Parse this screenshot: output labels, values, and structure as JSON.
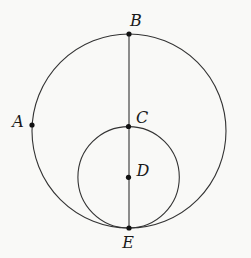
{
  "figure": {
    "canvas": {
      "width": 251,
      "height": 258
    },
    "colors": {
      "background": "#f9f9f7",
      "stroke": "#333333",
      "dot": "#111111",
      "label": "#1a1a1a"
    },
    "style": {
      "stroke_width": 1.1,
      "dot_radius": 2.6,
      "label_font_size": 16
    },
    "circles": [
      {
        "name": "large-circle",
        "cx": 129,
        "cy": 131,
        "r": 97
      },
      {
        "name": "small-circle",
        "cx": 128.6,
        "cy": 177.3,
        "r": 50.7
      }
    ],
    "segment": {
      "name": "diameter-BE",
      "x1": 129,
      "y1": 34,
      "x2": 129,
      "y2": 228
    },
    "points": [
      {
        "label": "B",
        "x": 129,
        "y": 34,
        "lx": 136,
        "ly": 20
      },
      {
        "label": "A",
        "x": 32,
        "y": 125,
        "lx": 18,
        "ly": 121
      },
      {
        "label": "C",
        "x": 128.5,
        "y": 126.5,
        "lx": 142,
        "ly": 117
      },
      {
        "label": "D",
        "x": 128.5,
        "y": 177.3,
        "lx": 143,
        "ly": 170
      },
      {
        "label": "E",
        "x": 129,
        "y": 228,
        "lx": 128,
        "ly": 242
      }
    ]
  }
}
